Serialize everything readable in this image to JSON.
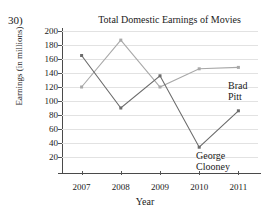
{
  "problem_number": "30)",
  "chart_data": {
    "type": "line",
    "title": "Total Domestic Earnings of Movies",
    "xlabel": "Year",
    "ylabel": "Earnings (in millions)",
    "categories": [
      "2007",
      "2008",
      "2009",
      "2010",
      "2011"
    ],
    "ylim": [
      0,
      200
    ],
    "ytick_values": [
      20,
      40,
      60,
      80,
      100,
      120,
      140,
      160,
      180,
      200
    ],
    "ytick_labels": [
      "20",
      "40",
      "60",
      "80",
      "100",
      "120",
      "140",
      "160",
      "180",
      "200"
    ],
    "grid": true,
    "legend_position": "inline-right",
    "series": [
      {
        "name": "Brad Pitt",
        "color": "#a8a8a8",
        "values": [
          120,
          187,
          120,
          146,
          148
        ]
      },
      {
        "name": "George Clooney",
        "color": "#6b6b6b",
        "values": [
          165,
          90,
          136,
          34,
          86
        ]
      }
    ],
    "annotations": [
      {
        "text": "Brad",
        "series": "Brad Pitt"
      },
      {
        "text": "Pitt",
        "series": "Brad Pitt"
      },
      {
        "text": "George",
        "series": "George Clooney"
      },
      {
        "text": "Clooney",
        "series": "George Clooney"
      }
    ]
  }
}
